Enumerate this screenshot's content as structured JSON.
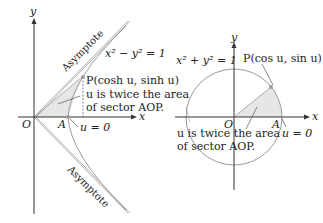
{
  "left_figure": {
    "axis_y": "y",
    "axis_x": "x",
    "origin": "O",
    "point_a": "A",
    "asymptote_upper": "Asymptote",
    "asymptote_lower": "Asymptote",
    "equation": "x² − y² = 1",
    "point_p": "P(cosh u, sinh u)",
    "note_line1": "u is twice the area",
    "note_line2": "of sector AOP.",
    "u_zero": "u = 0"
  },
  "right_figure": {
    "axis_y": "y",
    "axis_x": "x",
    "origin": "O",
    "point_a": "A",
    "equation": "x² + y² = 1",
    "point_p": "P(cos u, sin u)",
    "note_line1": "u is twice the area",
    "note_line2": "of sector AOP.",
    "u_zero": "u = 0"
  },
  "colors": {
    "curve": "#9a9a9a",
    "shade": "#e6e6e6",
    "axis": "#333333",
    "point": "#9a9a9a"
  }
}
